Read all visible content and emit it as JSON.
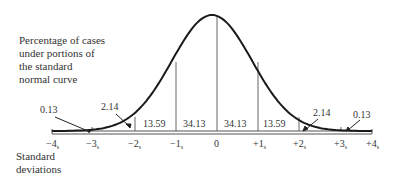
{
  "chart_data": {
    "type": "area",
    "title": "Percentage of cases under portions of the standard normal curve",
    "description_lines": [
      "Percentage of cases",
      "under portions of",
      "the standard",
      "normal curve"
    ],
    "xlabel": "Standard deviations",
    "xlabel_lines": [
      "Standard",
      "deviations"
    ],
    "ylabel": "",
    "x_ticks": [
      "−4s",
      "−3s",
      "−2s",
      "−1s",
      "0",
      "+1s",
      "+2s",
      "+3s",
      "+4s"
    ],
    "x_tick_values": [
      -4,
      -3,
      -2,
      -1,
      0,
      1,
      2,
      3,
      4
    ],
    "xlim": [
      -4,
      4
    ],
    "grid": false,
    "legend": null,
    "regions": [
      {
        "from": -4,
        "to": -3,
        "percent": 0.13
      },
      {
        "from": -3,
        "to": -2,
        "percent": 2.14
      },
      {
        "from": -2,
        "to": -1,
        "percent": 13.59
      },
      {
        "from": -1,
        "to": 0,
        "percent": 34.13
      },
      {
        "from": 0,
        "to": 1,
        "percent": 34.13
      },
      {
        "from": 1,
        "to": 2,
        "percent": 13.59
      },
      {
        "from": 2,
        "to": 3,
        "percent": 2.14
      },
      {
        "from": 3,
        "to": 4,
        "percent": 0.13
      }
    ],
    "labels": {
      "r0": "0.13",
      "r1": "2.14",
      "r2": "13.59",
      "r3": "34.13",
      "r4": "34.13",
      "r5": "13.59",
      "r6": "2.14",
      "r7": "0.13"
    },
    "tick_labels": {
      "t0": {
        "sign": "−4",
        "sub": "s"
      },
      "t1": {
        "sign": "−3",
        "sub": "s"
      },
      "t2": {
        "sign": "−2",
        "sub": "s"
      },
      "t3": {
        "sign": "−1",
        "sub": "s"
      },
      "t4": {
        "sign": "0",
        "sub": ""
      },
      "t5": {
        "sign": "+1",
        "sub": "s"
      },
      "t6": {
        "sign": "+2",
        "sub": "s"
      },
      "t7": {
        "sign": "+3",
        "sub": "s"
      },
      "t8": {
        "sign": "+4",
        "sub": "s"
      }
    }
  }
}
